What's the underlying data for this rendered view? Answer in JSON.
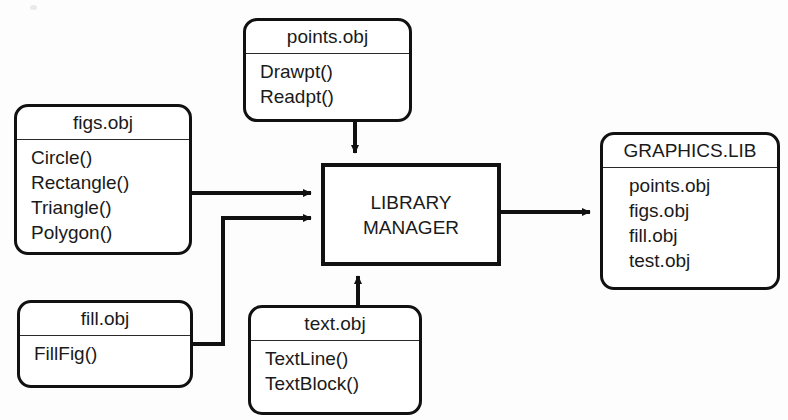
{
  "diagram": {
    "title_text": "",
    "canvas": {
      "width": 788,
      "height": 420,
      "background": "#fdfdfd"
    },
    "stroke_color": "#111111",
    "text_color": "#1a1a1a"
  },
  "nodes": {
    "points_obj": {
      "title": "points.obj",
      "members": [
        "Drawpt()",
        "Readpt()"
      ],
      "shape": "rounded-rect",
      "x": 243,
      "y": 18,
      "w": 169,
      "h": 104
    },
    "figs_obj": {
      "title": "figs.obj",
      "members": [
        "Circle()",
        "Rectangle()",
        "Triangle()",
        "Polygon()"
      ],
      "shape": "rounded-rect",
      "x": 14,
      "y": 104,
      "w": 178,
      "h": 151
    },
    "fill_obj": {
      "title": "fill.obj",
      "members": [
        "FillFig()"
      ],
      "shape": "rounded-rect",
      "x": 17,
      "y": 300,
      "w": 176,
      "h": 88
    },
    "text_obj": {
      "title": "text.obj",
      "members": [
        "TextLine()",
        "TextBlock()"
      ],
      "shape": "rounded-rect",
      "x": 248,
      "y": 305,
      "w": 174,
      "h": 110
    },
    "library_manager": {
      "title": "LIBRARY MANAGER",
      "line1": "LIBRARY",
      "line2": "MANAGER",
      "members": [],
      "shape": "rect",
      "x": 321,
      "y": 163,
      "w": 180,
      "h": 103
    },
    "graphics_lib": {
      "title": "GRAPHICS.LIB",
      "members": [
        "points.obj",
        "figs.obj",
        "fill.obj",
        "test.obj"
      ],
      "shape": "rounded-rect",
      "x": 600,
      "y": 132,
      "w": 180,
      "h": 158
    }
  },
  "connections": [
    {
      "id": "points-to-manager",
      "from": "points_obj",
      "to": "library_manager",
      "label": "",
      "direction": "down"
    },
    {
      "id": "figs-to-manager",
      "from": "figs_obj",
      "to": "library_manager",
      "label": "",
      "direction": "right"
    },
    {
      "id": "fill-to-manager",
      "from": "fill_obj",
      "to": "library_manager",
      "label": "",
      "direction": "right-up-right"
    },
    {
      "id": "text-to-manager",
      "from": "text_obj",
      "to": "library_manager",
      "label": "",
      "direction": "up"
    },
    {
      "id": "manager-to-graphicslib",
      "from": "library_manager",
      "to": "graphics_lib",
      "label": "",
      "direction": "right"
    }
  ]
}
